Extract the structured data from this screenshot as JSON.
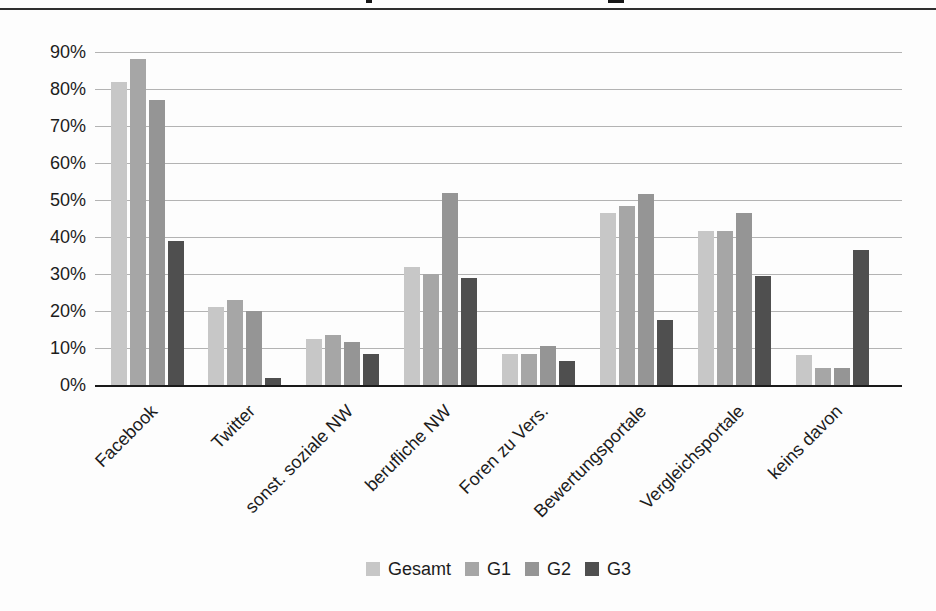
{
  "page": {
    "background": "#fdfdfd",
    "text_color": "#1c1c1c"
  },
  "chart_data": {
    "type": "bar",
    "title": "",
    "categories": [
      "Facebook",
      "Twitter",
      "sonst. soziale NW",
      "berufliche NW",
      "Foren zu Vers.",
      "Bewertungsportale",
      "Vergleichsportale",
      "keins davon"
    ],
    "series": [
      {
        "name": "Gesamt",
        "color": "#c7c7c7",
        "values": [
          82,
          21,
          12.5,
          32,
          8.5,
          46.5,
          41.5,
          8
        ]
      },
      {
        "name": "G1",
        "color": "#a6a6a6",
        "values": [
          88,
          23,
          13.5,
          30,
          8.5,
          48.5,
          41.5,
          4.5
        ]
      },
      {
        "name": "G2",
        "color": "#959595",
        "values": [
          77,
          20,
          11.5,
          52,
          10.5,
          51.5,
          46.5,
          4.5
        ]
      },
      {
        "name": "G3",
        "color": "#4f4f4f",
        "values": [
          39,
          2,
          8.5,
          29,
          6.5,
          17.5,
          29.5,
          36.5
        ]
      }
    ],
    "y_axis": {
      "min": 0,
      "max": 90,
      "step": 10,
      "suffix": "%",
      "tick_labels": [
        "0%",
        "10%",
        "20%",
        "30%",
        "40%",
        "50%",
        "60%",
        "70%",
        "80%",
        "90%"
      ]
    },
    "x_label_rotation_deg": -45,
    "grid": true,
    "gridline_color": "#b3b3b3",
    "axis_line_color": "#1a1a1a",
    "legend_position": "bottom"
  }
}
